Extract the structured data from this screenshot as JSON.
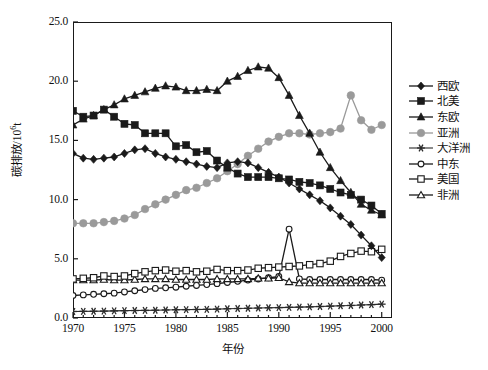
{
  "chart_data": {
    "type": "line",
    "title": "",
    "xlabel": "年份",
    "ylabel": "碳排放/10⁶t",
    "ylabel_base": "碳排放/10",
    "ylabel_exp": "6",
    "ylabel_unit": "t",
    "xlim": [
      1970,
      2001
    ],
    "ylim": [
      0.0,
      25.0
    ],
    "grid": false,
    "legend_position": "right",
    "xticks": [
      1970,
      1975,
      1980,
      1985,
      1990,
      1995,
      2000
    ],
    "xtick_labels": [
      "1970",
      "1975",
      "1980",
      "1985",
      "1990",
      "1995",
      "2000"
    ],
    "yticks": [
      0.0,
      5.0,
      10.0,
      15.0,
      20.0,
      25.0
    ],
    "ytick_labels": [
      "0.0",
      "5.0",
      "10.0",
      "15.0",
      "20.0",
      "25.0"
    ],
    "x": [
      1970,
      1971,
      1972,
      1973,
      1974,
      1975,
      1976,
      1977,
      1978,
      1979,
      1980,
      1981,
      1982,
      1983,
      1984,
      1985,
      1986,
      1987,
      1988,
      1989,
      1990,
      1991,
      1992,
      1993,
      1994,
      1995,
      1996,
      1997,
      1998,
      1999,
      2000
    ],
    "series": [
      {
        "name": "西欧",
        "marker": "filled-diamond",
        "color": "#1a1a1a",
        "values": [
          13.9,
          13.5,
          13.4,
          13.5,
          13.6,
          13.9,
          14.2,
          14.3,
          13.9,
          13.6,
          13.4,
          13.2,
          13.0,
          12.8,
          12.7,
          13.1,
          13.2,
          13.1,
          12.7,
          12.3,
          11.9,
          11.4,
          10.9,
          10.4,
          9.9,
          9.3,
          8.6,
          7.9,
          7.0,
          6.1,
          5.1
        ]
      },
      {
        "name": "北美",
        "marker": "filled-square",
        "color": "#1a1a1a",
        "values": [
          17.5,
          17.0,
          17.1,
          17.6,
          17.0,
          16.4,
          16.3,
          15.6,
          15.6,
          15.6,
          14.5,
          14.6,
          14.0,
          14.1,
          13.3,
          12.7,
          12.2,
          11.9,
          11.9,
          11.9,
          11.8,
          11.7,
          11.5,
          11.4,
          11.2,
          10.9,
          10.6,
          10.4,
          10.0,
          9.5,
          8.8
        ]
      },
      {
        "name": "东欧",
        "marker": "filled-triangle",
        "color": "#1a1a1a",
        "values": [
          16.3,
          16.8,
          17.1,
          17.6,
          18.0,
          18.5,
          18.8,
          19.1,
          19.4,
          19.6,
          19.5,
          19.2,
          19.2,
          19.3,
          19.2,
          20.0,
          20.4,
          20.9,
          21.2,
          21.1,
          20.3,
          18.8,
          17.1,
          15.6,
          14.0,
          12.7,
          11.6,
          10.6,
          9.6,
          9.1,
          8.7
        ]
      },
      {
        "name": "亚洲",
        "marker": "filled-circle",
        "color": "#9a9a9a",
        "values": [
          8.0,
          8.0,
          8.0,
          8.1,
          8.2,
          8.4,
          8.7,
          9.2,
          9.6,
          10.0,
          10.4,
          10.8,
          11.0,
          11.4,
          11.8,
          12.4,
          13.0,
          13.7,
          14.3,
          14.9,
          15.3,
          15.6,
          15.6,
          15.5,
          15.6,
          15.7,
          16.0,
          18.8,
          16.7,
          15.9,
          16.3
        ]
      },
      {
        "name": "大洋洲",
        "marker": "asterisk",
        "color": "#2a2a2a",
        "values": [
          0.55,
          0.56,
          0.57,
          0.58,
          0.6,
          0.62,
          0.63,
          0.64,
          0.66,
          0.68,
          0.7,
          0.71,
          0.72,
          0.73,
          0.75,
          0.78,
          0.8,
          0.82,
          0.84,
          0.86,
          0.88,
          0.9,
          0.92,
          0.94,
          0.97,
          1.0,
          1.03,
          1.06,
          1.1,
          1.13,
          1.17
        ]
      },
      {
        "name": "中东",
        "marker": "open-circle",
        "color": "#1a1a1a",
        "values": [
          1.9,
          1.95,
          2.0,
          2.05,
          2.1,
          2.2,
          2.3,
          2.4,
          2.5,
          2.55,
          2.6,
          2.68,
          2.75,
          2.82,
          2.9,
          3.0,
          3.1,
          3.2,
          3.3,
          3.4,
          3.5,
          7.5,
          3.3,
          3.25,
          3.25,
          3.25,
          3.25,
          3.25,
          3.25,
          3.25,
          3.2
        ]
      },
      {
        "name": "美国",
        "marker": "open-square",
        "color": "#1a1a1a",
        "values": [
          3.3,
          3.35,
          3.4,
          3.55,
          3.5,
          3.55,
          3.75,
          3.9,
          4.0,
          4.05,
          3.95,
          4.0,
          3.9,
          3.95,
          4.1,
          4.0,
          4.0,
          4.05,
          4.2,
          4.25,
          4.3,
          4.35,
          4.4,
          4.5,
          4.6,
          4.8,
          5.2,
          5.45,
          5.65,
          5.6,
          5.8
        ]
      },
      {
        "name": "非洲",
        "marker": "open-triangle",
        "color": "#1a1a1a",
        "values": [
          3.2,
          3.2,
          3.2,
          3.25,
          3.2,
          3.2,
          3.25,
          3.3,
          3.3,
          3.3,
          3.25,
          3.25,
          3.25,
          3.25,
          3.3,
          3.3,
          3.3,
          3.3,
          3.35,
          3.35,
          3.4,
          3.05,
          2.95,
          2.95,
          2.95,
          2.95,
          2.95,
          2.95,
          2.95,
          2.95,
          2.95
        ]
      }
    ]
  }
}
